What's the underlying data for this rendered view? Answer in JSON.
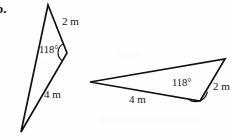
{
  "figure": {
    "part_letter": "b.",
    "units": "m",
    "triangles": [
      {
        "id": "left-triangle",
        "name": "obtuse-thin-triangle",
        "labels": {
          "side_short": "2 m",
          "side_long": "4 m",
          "angle": "118°"
        },
        "vertices": {
          "top": [
            48,
            5
          ],
          "right": [
            67,
            53
          ],
          "bottom": [
            21,
            132
          ]
        },
        "angle_vertex": "right",
        "angle_arc_radius": 9
      },
      {
        "id": "right-triangle",
        "name": "obtuse-wide-triangle",
        "labels": {
          "side_short": "2 m",
          "side_long": "4 m",
          "angle": "118°"
        },
        "vertices": {
          "left": [
            90,
            82
          ],
          "top_right": [
            225,
            59
          ],
          "bottom": [
            200,
            101
          ]
        },
        "angle_vertex": "bottom",
        "angle_arc_radius": 11
      }
    ],
    "colors": {
      "stroke": "#111111",
      "background": "#fefefe",
      "text": "#131313"
    },
    "stroke_width": 1.6
  }
}
